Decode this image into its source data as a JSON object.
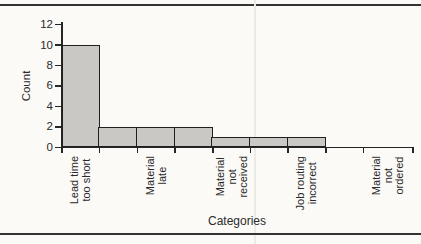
{
  "page": {
    "background_color": "#fbfaf7",
    "rule_color": "#333333",
    "crease_color": "#ebebe6"
  },
  "chart_data": {
    "type": "bar",
    "title": "",
    "xlabel": "Categories",
    "ylabel": "Count",
    "ylim": [
      0,
      12
    ],
    "yticks": [
      0,
      2,
      4,
      6,
      8,
      10,
      12
    ],
    "grid": false,
    "legend": null,
    "bin_heights": [
      10,
      2,
      2,
      2,
      1,
      1,
      1,
      0,
      0
    ],
    "categories": [
      {
        "label": "Lead time too short",
        "label_lines": [
          "Lead time",
          "too short"
        ],
        "bin_index": 0,
        "count": 10
      },
      {
        "label": "Material late",
        "label_lines": [
          "Material",
          "late"
        ],
        "bin_index": 2,
        "count": 2
      },
      {
        "label": "Material not received",
        "label_lines": [
          "Material",
          "not",
          "received"
        ],
        "bin_index": 4,
        "count": 1
      },
      {
        "label": "Job routing incorrect",
        "label_lines": [
          "Job routing",
          "incorrect"
        ],
        "bin_index": 6,
        "count": 1
      },
      {
        "label": "Material not ordered",
        "label_lines": [
          "Material",
          "not",
          "ordered"
        ],
        "bin_index": 8,
        "count": 0
      }
    ],
    "bar_fill_color": "#c9c8c4",
    "bar_border_color": "#1f1f1f",
    "axis_color": "#262626"
  }
}
